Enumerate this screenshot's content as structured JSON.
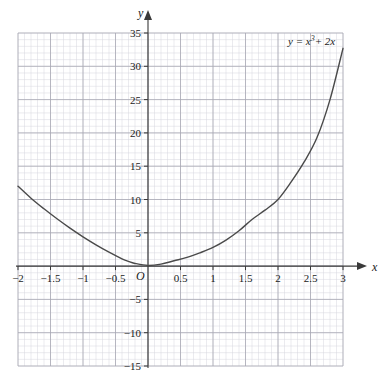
{
  "figure": {
    "background_color": "#ffffff",
    "grid_minor_color": "#d7d7df",
    "grid_major_color": "#a8a8b4",
    "axis_color": "#3a3a3a",
    "curve_color": "#4a4a4a",
    "text_color": "#1a1a1a"
  },
  "labels": {
    "x_axis_name": "x",
    "y_axis_name": "y",
    "origin": "O",
    "curve_equation_prefix": "y = x",
    "curve_equation_exponent": "3",
    "curve_equation_suffix": "+ 2x",
    "curve_equation_full": "y = x³ + 2x"
  },
  "chart_data": {
    "type": "line",
    "title": "",
    "xlabel": "x",
    "ylabel": "y",
    "equation": "y = x³ + 2x",
    "xlim": [
      -2,
      3
    ],
    "ylim": [
      -15,
      35
    ],
    "grid": true,
    "grid_minor_step_x": 0.1,
    "grid_minor_step_y": 1,
    "grid_major_step_x": 0.5,
    "grid_major_step_y": 5,
    "legend_position": "top-right-inside",
    "x_tick_labels": [
      "-2",
      "-1.5",
      "-1",
      "-0.5",
      "0.5",
      "1",
      "1.5",
      "2",
      "2.5",
      "3"
    ],
    "x_tick_values": [
      -2,
      -1.5,
      -1,
      -0.5,
      0.5,
      1,
      1.5,
      2,
      2.5,
      3
    ],
    "y_tick_labels": [
      "35",
      "30",
      "25",
      "20",
      "15",
      "10",
      "5",
      "-5",
      "-10",
      "-15"
    ],
    "y_tick_values": [
      35,
      30,
      25,
      20,
      15,
      10,
      5,
      -5,
      -10,
      -15
    ],
    "x": [
      -2,
      -1.8,
      -1.6,
      -1.4,
      -1.2,
      -1,
      -0.8,
      -0.6,
      -0.4,
      -0.3,
      -0.2,
      0,
      0.2,
      0.4,
      0.6,
      0.8,
      1,
      1.2,
      1.4,
      1.6,
      1.8,
      2,
      2.2,
      2.4,
      2.6,
      2.8,
      3
    ],
    "y": [
      12,
      10.2,
      8.6,
      7.1,
      5.7,
      4.4,
      3.2,
      2.1,
      1.1,
      0.7,
      0.4,
      0.1,
      0.3,
      0.8,
      1.3,
      2,
      2.8,
      3.9,
      5.3,
      7,
      8.4,
      10,
      12.6,
      15.6,
      19.3,
      25,
      32.7
    ],
    "series": [
      {
        "name": "y = x³ + 2x",
        "x": [
          -2,
          -1.8,
          -1.6,
          -1.4,
          -1.2,
          -1,
          -0.8,
          -0.6,
          -0.4,
          -0.3,
          -0.2,
          0,
          0.2,
          0.4,
          0.6,
          0.8,
          1,
          1.2,
          1.4,
          1.6,
          1.8,
          2,
          2.2,
          2.4,
          2.6,
          2.8,
          3
        ],
        "y": [
          12,
          10.2,
          8.6,
          7.1,
          5.7,
          4.4,
          3.2,
          2.1,
          1.1,
          0.7,
          0.4,
          0.1,
          0.3,
          0.8,
          1.3,
          2,
          2.8,
          3.9,
          5.3,
          7,
          8.4,
          10,
          12.6,
          15.6,
          19.3,
          25,
          32.7
        ]
      }
    ]
  }
}
